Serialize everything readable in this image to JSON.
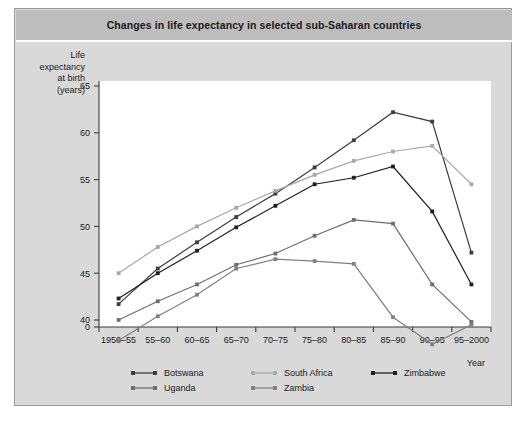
{
  "figure": {
    "title": "Changes in life expectancy in selected sub-Saharan countries",
    "background": "#d9d9d9",
    "title_band": "#bdbdbd"
  },
  "chart_data": {
    "type": "line",
    "title": "Changes in life expectancy in selected sub-Saharan countries",
    "xlabel": "Year",
    "ylabel": "Life expectancy at birth (years)",
    "ylabel_lines": [
      "Life",
      "expectancy",
      "at birth",
      "(years)"
    ],
    "categories": [
      "1950–55",
      "55–60",
      "60–65",
      "65–70",
      "70–75",
      "75–80",
      "80–85",
      "85–90",
      "90–95",
      "95–2000"
    ],
    "yticks": [
      0,
      40,
      45,
      50,
      55,
      60,
      65
    ],
    "ylim": [
      37,
      65
    ],
    "axis_break": true,
    "grid": false,
    "legend_position": "bottom",
    "series": [
      {
        "name": "Botswana",
        "color": "#3d3d3d",
        "values": [
          41.7,
          45.5,
          48.3,
          51.0,
          53.5,
          56.3,
          59.2,
          62.2,
          61.2,
          47.2
        ]
      },
      {
        "name": "South Africa",
        "color": "#a8a8a8",
        "values": [
          45.0,
          47.8,
          50.0,
          52.0,
          53.8,
          55.5,
          57.0,
          58.0,
          58.6,
          54.5
        ]
      },
      {
        "name": "Zimbabwe",
        "color": "#1f1f1f",
        "values": [
          42.3,
          45.0,
          47.4,
          49.9,
          52.2,
          54.5,
          55.2,
          56.4,
          51.6,
          43.8
        ]
      },
      {
        "name": "Uganda",
        "color": "#6e6e6e",
        "values": [
          40.0,
          42.0,
          43.8,
          45.9,
          47.1,
          49.0,
          50.7,
          50.3,
          43.8,
          39.8
        ]
      },
      {
        "name": "Zambia",
        "color": "#808080",
        "values": [
          37.8,
          40.4,
          42.7,
          45.5,
          46.5,
          46.3,
          46.0,
          40.3,
          37.4,
          39.5
        ]
      }
    ]
  },
  "legend": {
    "items": [
      {
        "label": "Botswana",
        "color": "#3d3d3d"
      },
      {
        "label": "South Africa",
        "color": "#a8a8a8"
      },
      {
        "label": "Zimbabwe",
        "color": "#1f1f1f"
      },
      {
        "label": "Uganda",
        "color": "#6e6e6e"
      },
      {
        "label": "Zambia",
        "color": "#808080"
      }
    ]
  }
}
